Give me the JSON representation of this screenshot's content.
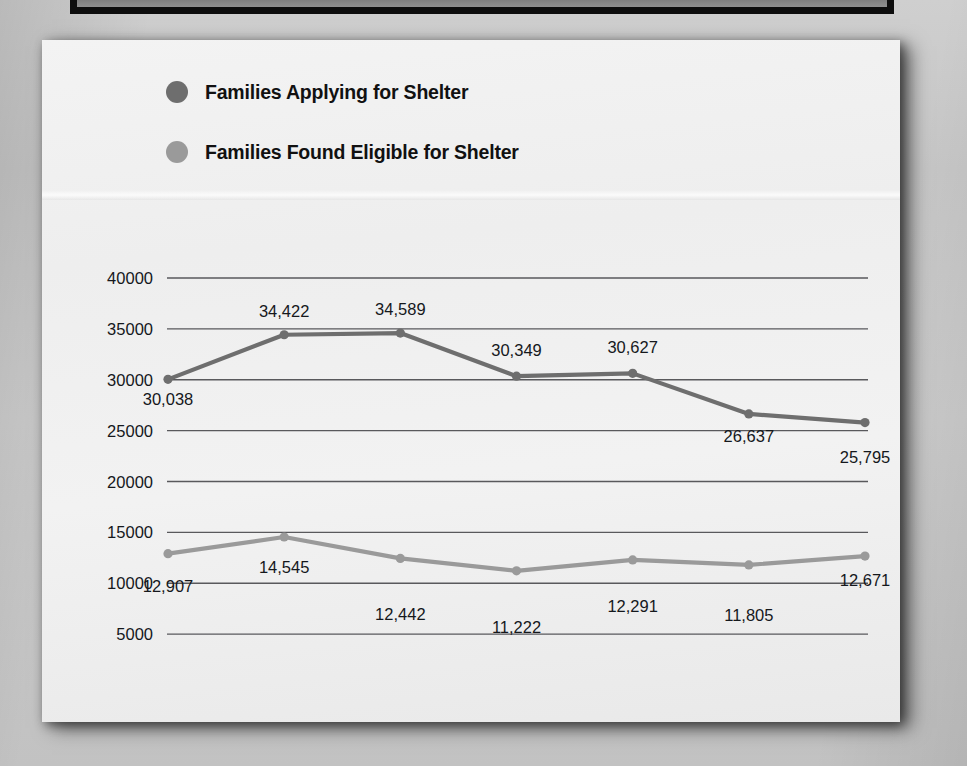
{
  "chart_data": {
    "type": "line",
    "title": "",
    "xlabel": "",
    "ylabel": "",
    "categories": [
      "2009",
      "2010",
      "2011",
      "2012",
      "2013",
      "2014",
      "2015"
    ],
    "ylim": [
      0,
      40000
    ],
    "ytick_values": [
      0,
      5000,
      10000,
      15000,
      20000,
      25000,
      30000,
      35000,
      40000
    ],
    "ytick_labels": [
      "0",
      "5000",
      "10000",
      "15000",
      "20000",
      "25000",
      "30000",
      "35000",
      "40000"
    ],
    "grid": true,
    "legend_position": "top-left",
    "series": [
      {
        "name": "Families Applying for Shelter",
        "color": "#6e6e6e",
        "values": [
          30038,
          34422,
          34589,
          30349,
          30627,
          26637,
          25795
        ],
        "labels": [
          "30,038",
          "34,422",
          "34,589",
          "30,349",
          "30,627",
          "26,637",
          "25,795"
        ],
        "label_offsets_y": [
          26,
          -18,
          -18,
          -20,
          -20,
          28,
          40
        ]
      },
      {
        "name": "Families Found Eligible for Shelter",
        "color": "#9a9a9a",
        "values": [
          12907,
          14545,
          12442,
          11222,
          12291,
          11805,
          12671
        ],
        "labels": [
          "12,907",
          "14,545",
          "12,442",
          "11,222",
          "12,291",
          "11,805",
          "12,671"
        ],
        "label_offsets_y": [
          38,
          36,
          62,
          62,
          52,
          56,
          30
        ]
      }
    ]
  },
  "legend": {
    "items": [
      {
        "label": "Families Applying for Shelter",
        "color": "#6e6e6e"
      },
      {
        "label": "Families Found Eligible for Shelter",
        "color": "#9a9a9a"
      }
    ]
  }
}
